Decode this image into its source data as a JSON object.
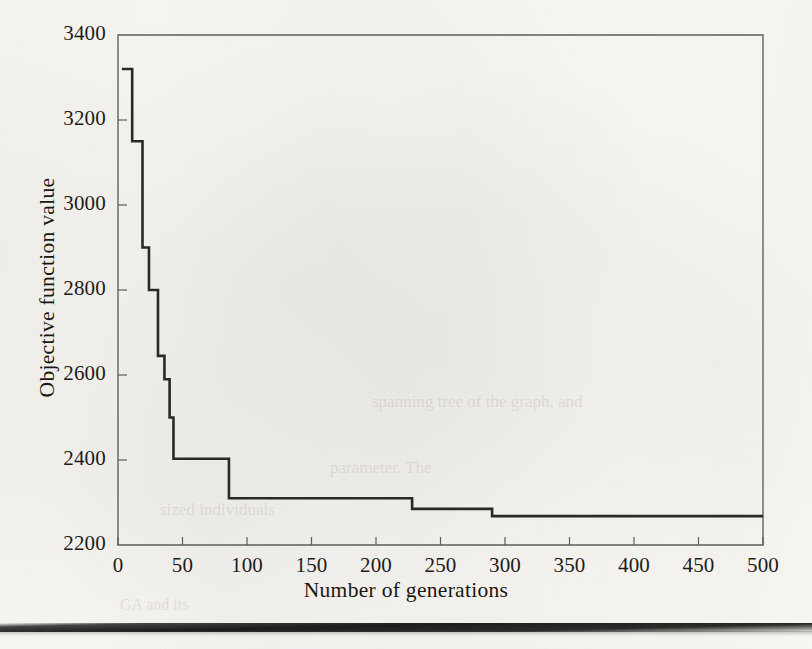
{
  "figure": {
    "background_color": "#fdfdfb",
    "axis_color": "#5d5c58",
    "series_color": "#2a2926",
    "text_color": "#19180f"
  },
  "chart_data": {
    "type": "line",
    "title": "",
    "subtitle": "",
    "xlabel": "Number of generations",
    "ylabel": "Objective function value",
    "xlim": [
      0,
      500
    ],
    "ylim": [
      2200,
      3400
    ],
    "xticks": [
      0,
      50,
      100,
      150,
      200,
      250,
      300,
      350,
      400,
      450,
      500
    ],
    "xtick_labels": [
      "0",
      "50",
      "100",
      "150",
      "200",
      "250",
      "300",
      "350",
      "400",
      "450",
      "500"
    ],
    "yticks": [
      2200,
      2400,
      2600,
      2800,
      3000,
      3200,
      3400
    ],
    "ytick_labels": [
      "2200",
      "2400",
      "2600",
      "2800",
      "3000",
      "3200",
      "3400"
    ],
    "grid": false,
    "legend": null,
    "legend_position": "none",
    "annotations": [],
    "series": [
      {
        "name": "Best objective function value",
        "step": "post",
        "x": [
          3,
          11,
          11,
          19,
          19,
          24,
          24,
          31,
          31,
          36,
          36,
          40,
          40,
          43,
          43,
          86,
          86,
          228,
          228,
          290,
          290,
          500
        ],
        "y": [
          3320,
          3320,
          3150,
          3150,
          2900,
          2900,
          2800,
          2800,
          2645,
          2645,
          2590,
          2590,
          2500,
          2500,
          2403,
          2403,
          2310,
          2310,
          2285,
          2285,
          2268,
          2268
        ]
      }
    ],
    "step_points": [
      {
        "generation": 3,
        "value": 3320
      },
      {
        "generation": 11,
        "value": 3150
      },
      {
        "generation": 19,
        "value": 2900
      },
      {
        "generation": 24,
        "value": 2800
      },
      {
        "generation": 31,
        "value": 2645
      },
      {
        "generation": 36,
        "value": 2590
      },
      {
        "generation": 40,
        "value": 2500
      },
      {
        "generation": 43,
        "value": 2403
      },
      {
        "generation": 86,
        "value": 2310
      },
      {
        "generation": 228,
        "value": 2285
      },
      {
        "generation": 290,
        "value": 2268
      },
      {
        "generation": 500,
        "value": 2268
      }
    ],
    "initial_value": 3320,
    "final_value": 2268
  },
  "scan_artifacts": {
    "bottom_bar": true,
    "ghost_text": [
      {
        "text": "spanning tree of the graph, and",
        "left": 372,
        "top": 392,
        "size": 17
      },
      {
        "text": "parameter. The",
        "left": 330,
        "top": 458,
        "size": 17
      },
      {
        "text": "sized individuals",
        "left": 160,
        "top": 500,
        "size": 17
      },
      {
        "text": "GA and its",
        "left": 120,
        "top": 596,
        "size": 16
      }
    ]
  }
}
